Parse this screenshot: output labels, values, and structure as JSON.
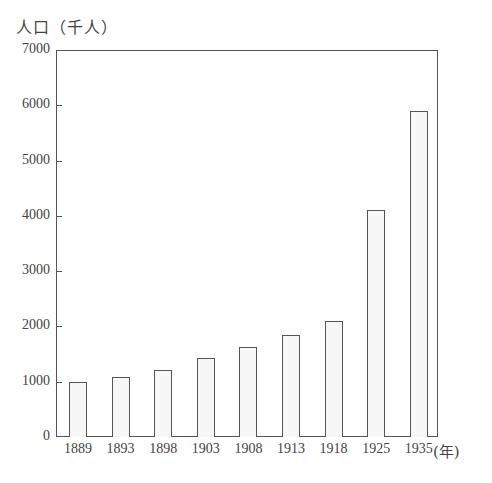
{
  "chart_data": {
    "type": "bar",
    "title": "",
    "xlabel": "(年)",
    "ylabel": "人口（千人）",
    "categories": [
      "1889",
      "1893",
      "1898",
      "1903",
      "1908",
      "1913",
      "1918",
      "1925",
      "1935"
    ],
    "values": [
      1000,
      1080,
      1210,
      1420,
      1620,
      1850,
      2100,
      4100,
      5890
    ],
    "ylim": [
      0,
      7000
    ],
    "yticks": [
      0,
      1000,
      2000,
      3000,
      4000,
      5000,
      6000,
      7000
    ],
    "grid": false,
    "legend": null,
    "colors": {
      "bar_fill": "#f7f7f7",
      "bar_edge": "#555555",
      "axis": "#555555"
    }
  },
  "labels": {
    "ylabel": "人口（千人）",
    "xunit": "(年)",
    "yticks": [
      "0",
      "1000",
      "2000",
      "3000",
      "4000",
      "5000",
      "6000",
      "7000"
    ],
    "xticks": [
      "1889",
      "1893",
      "1898",
      "1903",
      "1908",
      "1913",
      "1918",
      "1925",
      "1935"
    ]
  }
}
